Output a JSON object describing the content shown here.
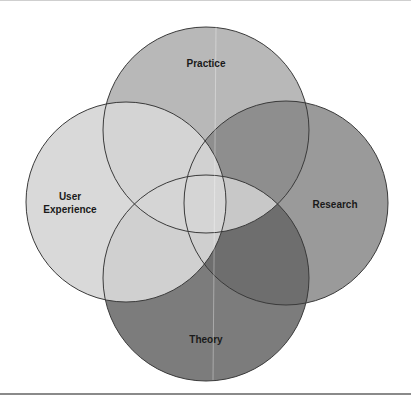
{
  "diagram": {
    "type": "venn",
    "sets": [
      {
        "id": "practice",
        "label": "Practice",
        "cx": 206,
        "cy": 130,
        "r": 103,
        "fill": "#b8b8b8",
        "label_x": 206,
        "label_y": 67
      },
      {
        "id": "research",
        "label": "Research",
        "cx": 286,
        "cy": 203,
        "r": 102,
        "fill": "#9a9a9a",
        "label_x": 335,
        "label_y": 208
      },
      {
        "id": "theory",
        "label": "Theory",
        "cx": 206,
        "cy": 278,
        "r": 103,
        "fill": "#7c7c7c",
        "label_x": 206,
        "label_y": 343
      },
      {
        "id": "user-experience",
        "label_line1": "User",
        "label_line2": "Experience",
        "cx": 126,
        "cy": 202,
        "r": 100,
        "fill": "#d6d6d6",
        "label_x": 70,
        "label_y": 200
      }
    ],
    "stroke_color": "#3a3a3a"
  },
  "labels": {
    "practice": "Practice",
    "research": "Research",
    "theory": "Theory",
    "ux_line1": "User",
    "ux_line2": "Experience"
  }
}
